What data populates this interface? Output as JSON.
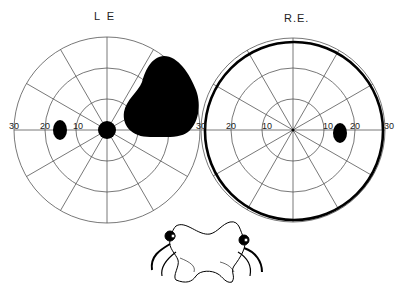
{
  "left_field": {
    "title": "L E",
    "center": [
      107,
      130
    ],
    "radius": 93,
    "rings_deg": [
      10,
      20,
      30
    ],
    "axis_labels": {
      "far_left": "30",
      "mid_left": "20",
      "near_left": "10",
      "far_right": "30"
    },
    "defects": [
      "blind-spot-enlarged-central",
      "paracentral-scotoma-temporal",
      "large-superior-nasal-scotoma"
    ]
  },
  "right_field": {
    "title": "R.E.",
    "center": [
      293,
      130
    ],
    "radius": 91,
    "rings_deg": [
      10,
      20,
      30
    ],
    "axis_labels": {
      "far_left": "30",
      "mid_left": "20",
      "near_left": "10",
      "near_right": "10",
      "mid_right": "20",
      "far_right": "30"
    },
    "defects": [
      "blind-spot",
      "peripheral-contraction-outline"
    ]
  },
  "illustration": {
    "label": "optic-chiasm-drawing"
  }
}
